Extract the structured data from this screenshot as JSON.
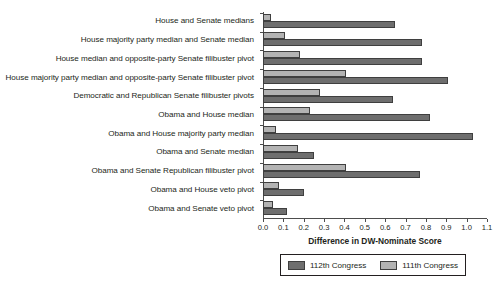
{
  "chart_data": {
    "type": "bar",
    "orientation": "horizontal",
    "title": "",
    "xlabel": "Difference in DW-Nominate Score",
    "ylabel": "",
    "xlim": [
      0.0,
      1.1
    ],
    "xticks": [
      "0.0",
      "0.1",
      "0.2",
      "0.3",
      "0.4",
      "0.5",
      "0.6",
      "0.7",
      "0.8",
      "0.9",
      "1.0",
      "1.1"
    ],
    "grid": false,
    "legend_position": "bottom",
    "categories": [
      "House and Senate medians",
      "House majority party median and Senate median",
      "House median and opposite-party Senate filibuster pivot",
      "House majority party median and opposite-party Senate filibuster pivot",
      "Democratic and Republican Senate filibuster pivots",
      "Obama and House median",
      "Obama and House majority party median",
      "Obama and Senate median",
      "Obama and Senate Republican filibuster pivot",
      "Obama and House veto pivot",
      "Obama and Senate veto pivot"
    ],
    "series": [
      {
        "name": "112th Congress",
        "color": "#6e6e6e",
        "values": [
          0.65,
          0.78,
          0.78,
          0.91,
          0.64,
          0.82,
          1.03,
          0.25,
          0.77,
          0.2,
          0.12
        ]
      },
      {
        "name": "111th Congress",
        "color": "#b3b3b3",
        "values": [
          0.04,
          0.11,
          0.18,
          0.41,
          0.28,
          0.23,
          0.065,
          0.17,
          0.41,
          0.08,
          0.05
        ]
      }
    ]
  },
  "legend": {
    "entries": [
      {
        "label": "112th Congress"
      },
      {
        "label": "111th Congress"
      }
    ]
  }
}
